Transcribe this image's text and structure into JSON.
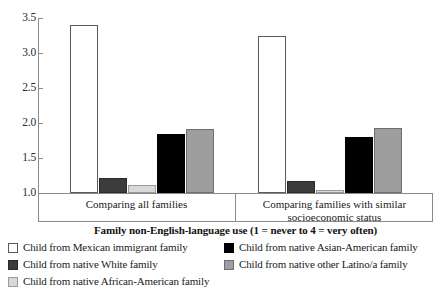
{
  "chart_data": {
    "type": "bar",
    "title": "",
    "xlabel": "Family non-English-language use (1 = never to 4 = very often)",
    "ylabel": "",
    "ylim": [
      1.0,
      3.5
    ],
    "yticks": [
      "3.5",
      "3.0",
      "2.5",
      "2.0",
      "1.5",
      "1.0"
    ],
    "ytick_values": [
      3.5,
      3.0,
      2.5,
      2.0,
      1.5,
      1.0
    ],
    "grid": false,
    "legend_position": "bottom",
    "categories": [
      "Comparing all families",
      "Comparing families with similar socioeconomic status"
    ],
    "category_lines": [
      [
        "Comparing all families"
      ],
      [
        "Comparing families with similar",
        "socioeconomic status"
      ]
    ],
    "series": [
      {
        "name": "Child from Mexican immigrant family",
        "color": "#ffffff",
        "values": [
          3.4,
          3.25
        ]
      },
      {
        "name": "Child from native White family",
        "color": "#3c3c3c",
        "values": [
          1.21,
          1.17
        ]
      },
      {
        "name": "Child from native African-American family",
        "color": "#d9d9d9",
        "values": [
          1.11,
          1.04
        ]
      },
      {
        "name": "Child from native Asian-American family",
        "color": "#000000",
        "values": [
          1.84,
          1.8
        ]
      },
      {
        "name": "Child from native other Latino/a family",
        "color": "#9e9e9e",
        "values": [
          1.92,
          1.93
        ]
      }
    ]
  },
  "legend": {
    "left_items": [
      {
        "label": "Child from Mexican immigrant family",
        "swatch": "white"
      },
      {
        "label": "Child from native White family",
        "swatch": "dark-gray"
      },
      {
        "label": "Child from native African-American family",
        "swatch": "light-gray"
      }
    ],
    "right_items": [
      {
        "label": "Child from native Asian-American family",
        "swatch": "black"
      },
      {
        "label": "Child from native other Latino/a family",
        "swatch": "medium-gray"
      }
    ]
  }
}
